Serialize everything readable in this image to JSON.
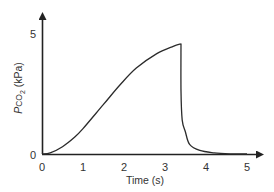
{
  "chart_data": {
    "type": "line",
    "title": "",
    "xlabel": "Time (s)",
    "ylabel": "Pco2 (kPa)",
    "ylabel_parts": {
      "p": "P",
      "co": "CO",
      "sub": "2",
      "unit": " (kPa)"
    },
    "xlim": [
      0,
      5
    ],
    "ylim": [
      0,
      5
    ],
    "x_ticks": [
      "0",
      "1",
      "2",
      "3",
      "4",
      "5"
    ],
    "y_ticks": [
      "0",
      "5"
    ],
    "grid": false,
    "legend": null,
    "series": [
      {
        "name": "Pco2",
        "x": [
          0,
          0.2,
          0.5,
          0.8,
          1.0,
          1.5,
          1.9,
          2.3,
          2.8,
          3.2,
          3.39,
          3.39,
          3.42,
          3.5,
          3.6,
          3.85,
          4.2,
          4.6,
          5.0
        ],
        "y": [
          0,
          0.05,
          0.3,
          0.7,
          1.05,
          2.05,
          2.85,
          3.55,
          4.15,
          4.45,
          4.55,
          2.6,
          1.4,
          0.9,
          0.4,
          0.15,
          0.05,
          0.01,
          0
        ]
      }
    ],
    "color": "#2b2b2b"
  }
}
